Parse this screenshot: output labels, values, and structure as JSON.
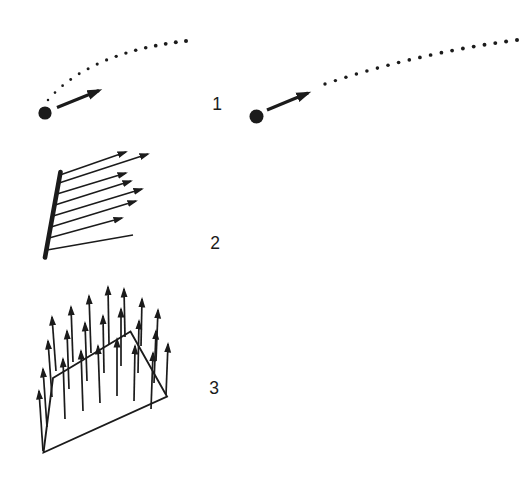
{
  "canvas": {
    "width": 527,
    "height": 488,
    "background": "#ffffff",
    "ink": "#1b1b1b"
  },
  "rows": [
    {
      "label": "1",
      "name": "particle-with-velocity-vector-and-dotted-trajectory"
    },
    {
      "label": "2",
      "name": "vectors-emanating-from-line-segment"
    },
    {
      "label": "3",
      "name": "upward-vector-field-on-plane-surface"
    }
  ],
  "icons": {
    "particle": "filled-dot",
    "velocity": "bold-arrow",
    "trajectory": "dotted-arc",
    "field_vector": "thin-arrow"
  }
}
